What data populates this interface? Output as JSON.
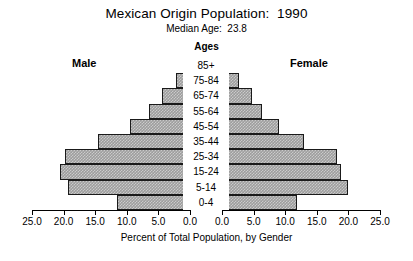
{
  "chart_data": {
    "type": "bar",
    "subtype": "population-pyramid",
    "title": "Mexican Origin Population:  1990",
    "subtitle": "Median Age:  23.8",
    "center_header": "Ages",
    "xlabel": "Percent of Total Population, by Gender",
    "ylabel": "Ages",
    "grid": false,
    "legend_position": "top-inline",
    "categories": [
      "85+",
      "75-84",
      "65-74",
      "55-64",
      "45-54",
      "35-44",
      "25-34",
      "15-24",
      "5-14",
      "0-4"
    ],
    "series": [
      {
        "name": "Male",
        "side": "left",
        "values": [
          0.5,
          2.2,
          4.4,
          6.5,
          9.5,
          14.5,
          19.8,
          20.6,
          19.3,
          11.6
        ]
      },
      {
        "name": "Female",
        "side": "right",
        "values": [
          0.7,
          2.7,
          4.8,
          6.4,
          9.0,
          13.0,
          18.2,
          18.8,
          19.9,
          11.9
        ]
      }
    ],
    "xlim_left": [
      25.0,
      0.0
    ],
    "xlim_right": [
      0.0,
      25.0
    ],
    "xticks_left": [
      "25.0",
      "20.0",
      "15.0",
      "10.0",
      "5.0",
      "0.0"
    ],
    "xticks_right": [
      "0.0",
      "5.0",
      "10.0",
      "15.0",
      "20.0",
      "25.0"
    ],
    "xtick_values_left": [
      25.0,
      20.0,
      15.0,
      10.0,
      5.0,
      0.0
    ],
    "xtick_values_right": [
      0.0,
      5.0,
      10.0,
      15.0,
      20.0,
      25.0
    ],
    "colors": {
      "bar_fill": "#9d9d9d",
      "bar_border": "#1a1a1a",
      "background": "#ffffff",
      "text": "#000000"
    }
  }
}
